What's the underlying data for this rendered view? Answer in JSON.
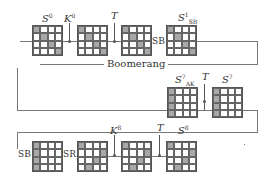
{
  "title": "Boomerang",
  "rows": [
    {
      "states": [
        {
          "label_main": "S",
          "label_sup": "0",
          "label_sub": "",
          "shaded": [
            [
              0,
              0
            ],
            [
              1,
              1
            ],
            [
              2,
              2
            ],
            [
              3,
              3
            ]
          ]
        },
        {
          "label_main": "",
          "label_sup": "",
          "label_sub": "",
          "shaded": [
            [
              0,
              0
            ],
            [
              1,
              1
            ],
            [
              2,
              2
            ],
            [
              3,
              3
            ]
          ]
        },
        {
          "label_main": "",
          "label_sup": "",
          "label_sub": "",
          "shaded": [
            [
              0,
              0
            ],
            [
              1,
              1
            ],
            [
              2,
              2
            ],
            [
              3,
              3
            ]
          ]
        },
        {
          "label_main": "S",
          "label_sup": "1",
          "label_sub": "SB",
          "shaded": [
            [
              0,
              0
            ],
            [
              1,
              1
            ],
            [
              2,
              2
            ],
            [
              3,
              3
            ]
          ]
        }
      ],
      "ops": [
        {
          "type": "xor",
          "label_main": "K",
          "label_sup": "0"
        },
        {
          "type": "xor",
          "label_main": "T",
          "label_sup": ""
        },
        {
          "type": "op",
          "label": "SB"
        }
      ]
    },
    {
      "states": [
        {
          "label_main": "S",
          "label_sup": "7",
          "label_sub": "AK",
          "shaded": [
            [
              0,
              0
            ],
            [
              1,
              0
            ],
            [
              2,
              0
            ],
            [
              3,
              0
            ]
          ]
        },
        {
          "label_main": "S",
          "label_sup": "7",
          "label_sub": "",
          "shaded": [
            [
              0,
              0
            ],
            [
              1,
              0
            ],
            [
              2,
              0
            ],
            [
              3,
              0
            ]
          ]
        }
      ],
      "ops": [
        {
          "type": "xor",
          "label_main": "T",
          "label_sup": ""
        }
      ]
    },
    {
      "states": [
        {
          "label_main": "",
          "label_sup": "",
          "label_sub": "",
          "shaded": [
            [
              0,
              0
            ],
            [
              1,
              0
            ],
            [
              2,
              0
            ],
            [
              3,
              0
            ]
          ]
        },
        {
          "label_main": "",
          "label_sup": "",
          "label_sub": "",
          "shaded": [
            [
              0,
              0
            ],
            [
              1,
              3
            ],
            [
              2,
              2
            ],
            [
              3,
              1
            ]
          ]
        },
        {
          "label_main": "",
          "label_sup": "",
          "label_sub": "",
          "shaded": [
            [
              0,
              0
            ],
            [
              1,
              3
            ],
            [
              2,
              2
            ],
            [
              3,
              1
            ]
          ]
        },
        {
          "label_main": "S",
          "label_sup": "8",
          "label_sub": "",
          "shaded": [
            [
              0,
              0
            ],
            [
              1,
              3
            ],
            [
              2,
              2
            ],
            [
              3,
              1
            ]
          ]
        }
      ],
      "ops": [
        {
          "type": "op",
          "label": "SB"
        },
        {
          "type": "op",
          "label": "SR"
        },
        {
          "type": "xor",
          "label_main": "K",
          "label_sup": "8"
        },
        {
          "type": "xor",
          "label_main": "T",
          "label_sup": ""
        }
      ]
    }
  ],
  "text": {
    "s0": "S",
    "s0_sup": "0",
    "k0": "K",
    "k0_sup": "0",
    "t1": "T",
    "sb1_op": "SB",
    "s1": "S",
    "s1_sup": "1",
    "s1_sub": "SB",
    "boomerang": "Boomerang",
    "s7ak": "S",
    "s7ak_sup": "7",
    "s7ak_sub": "AK",
    "t2": "T",
    "s7": "S",
    "s7_sup": "7",
    "sb2_op": "SB",
    "sr_op": "SR",
    "k8": "K",
    "k8_sup": "8",
    "t3": "T",
    "s8": "S",
    "s8_sup": "8"
  }
}
